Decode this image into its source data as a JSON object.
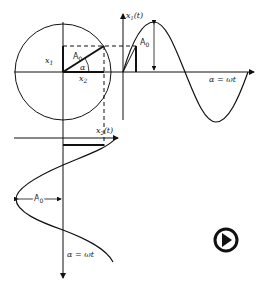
{
  "diagram": {
    "labels": {
      "x1": "x",
      "x1_sub": "1",
      "x2": "x",
      "x2_sub": "2",
      "amplitude": "A",
      "amplitude_sub": "0",
      "angle": "α",
      "x1_t_axis": "x",
      "x1_t_sub": "1",
      "x1_t_arg": "(t)",
      "x2_t_axis": "x",
      "x2_t_sub": "2",
      "x2_t_arg": "(t)",
      "horizontal_axis": "α = ωt",
      "vertical_axis": "α = ωt",
      "upper_amplitude": "A",
      "upper_amplitude_sub": "0",
      "lower_amplitude": "A",
      "lower_amplitude_sub": "0"
    },
    "colors": {
      "stroke": "#111111",
      "background": "#ffffff"
    }
  },
  "controls": {
    "play_button": {
      "icon": "play-circle-icon"
    }
  }
}
